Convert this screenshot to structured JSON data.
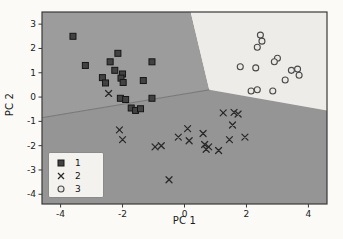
{
  "figure": {
    "background": "#fbfaf7",
    "xlabel": "PC 1",
    "ylabel": "PC 2"
  },
  "chart_data": {
    "type": "scatter",
    "title": "",
    "xlabel": "PC 1",
    "ylabel": "PC 2",
    "xlim": [
      -4.6,
      4.6
    ],
    "ylim": [
      -4.4,
      3.5
    ],
    "x_ticks": [
      -4,
      -2,
      0,
      2,
      4
    ],
    "y_ticks": [
      -4,
      -3,
      -2,
      -1,
      0,
      1,
      2,
      3
    ],
    "grid": false,
    "axis_color": "#3a3a3a",
    "tick_label_color": "#1a1a1a",
    "legend": {
      "position": "lower left",
      "background": "#f3f2ee",
      "entries": [
        {
          "label": "1",
          "marker": "square"
        },
        {
          "label": "2",
          "marker": "cross"
        },
        {
          "label": "3",
          "marker": "circle"
        }
      ]
    },
    "decision_regions": {
      "junction": [
        0.8,
        0.3
      ],
      "top_crossing": [
        0.2,
        3.5
      ],
      "left_crossing": [
        -4.6,
        -0.85
      ],
      "right_crossing": [
        4.6,
        -0.55
      ],
      "colors": {
        "region_1": "#9c9c9c",
        "region_2": "#959595",
        "region_3": "#edece8"
      },
      "boundary_line_color": "#6e6e6e"
    },
    "series": [
      {
        "name": "1",
        "marker": "square",
        "fill": "#424242",
        "edge": "#161616",
        "points": [
          [
            -3.6,
            2.5
          ],
          [
            -3.2,
            1.3
          ],
          [
            -2.15,
            1.8
          ],
          [
            -2.4,
            1.45
          ],
          [
            -2.25,
            1.1
          ],
          [
            -2.0,
            0.95
          ],
          [
            -2.05,
            0.78
          ],
          [
            -1.98,
            0.6
          ],
          [
            -1.05,
            1.45
          ],
          [
            -2.65,
            0.8
          ],
          [
            -2.55,
            0.58
          ],
          [
            -1.33,
            0.68
          ],
          [
            -2.07,
            -0.05
          ],
          [
            -1.9,
            -0.1
          ],
          [
            -1.05,
            -0.05
          ],
          [
            -1.72,
            -0.45
          ],
          [
            -1.58,
            -0.55
          ],
          [
            -1.42,
            -0.48
          ]
        ]
      },
      {
        "name": "2",
        "marker": "cross",
        "color": "#2a2a2a",
        "points": [
          [
            -2.45,
            0.15
          ],
          [
            -2.1,
            -1.35
          ],
          [
            -2.0,
            -1.75
          ],
          [
            -0.95,
            -2.05
          ],
          [
            -0.75,
            -2.0
          ],
          [
            -0.2,
            -1.65
          ],
          [
            0.1,
            -1.3
          ],
          [
            0.15,
            -1.8
          ],
          [
            0.6,
            -1.5
          ],
          [
            0.65,
            -1.95
          ],
          [
            0.78,
            -2.05
          ],
          [
            0.7,
            -2.15
          ],
          [
            1.1,
            -2.2
          ],
          [
            1.25,
            -0.65
          ],
          [
            1.6,
            -0.63
          ],
          [
            1.73,
            -0.7
          ],
          [
            1.55,
            -1.15
          ],
          [
            1.45,
            -1.75
          ],
          [
            1.95,
            -1.65
          ],
          [
            -0.5,
            -3.4
          ]
        ]
      },
      {
        "name": "3",
        "marker": "circle",
        "fill": "#eae9e5",
        "edge": "#4a4a4a",
        "points": [
          [
            2.45,
            2.55
          ],
          [
            2.5,
            2.3
          ],
          [
            2.35,
            2.05
          ],
          [
            3.0,
            1.6
          ],
          [
            2.9,
            1.45
          ],
          [
            1.8,
            1.25
          ],
          [
            2.3,
            1.2
          ],
          [
            3.45,
            1.1
          ],
          [
            3.65,
            1.15
          ],
          [
            3.7,
            0.9
          ],
          [
            3.25,
            0.7
          ],
          [
            2.15,
            0.25
          ],
          [
            2.35,
            0.3
          ],
          [
            2.85,
            0.25
          ]
        ]
      }
    ]
  }
}
